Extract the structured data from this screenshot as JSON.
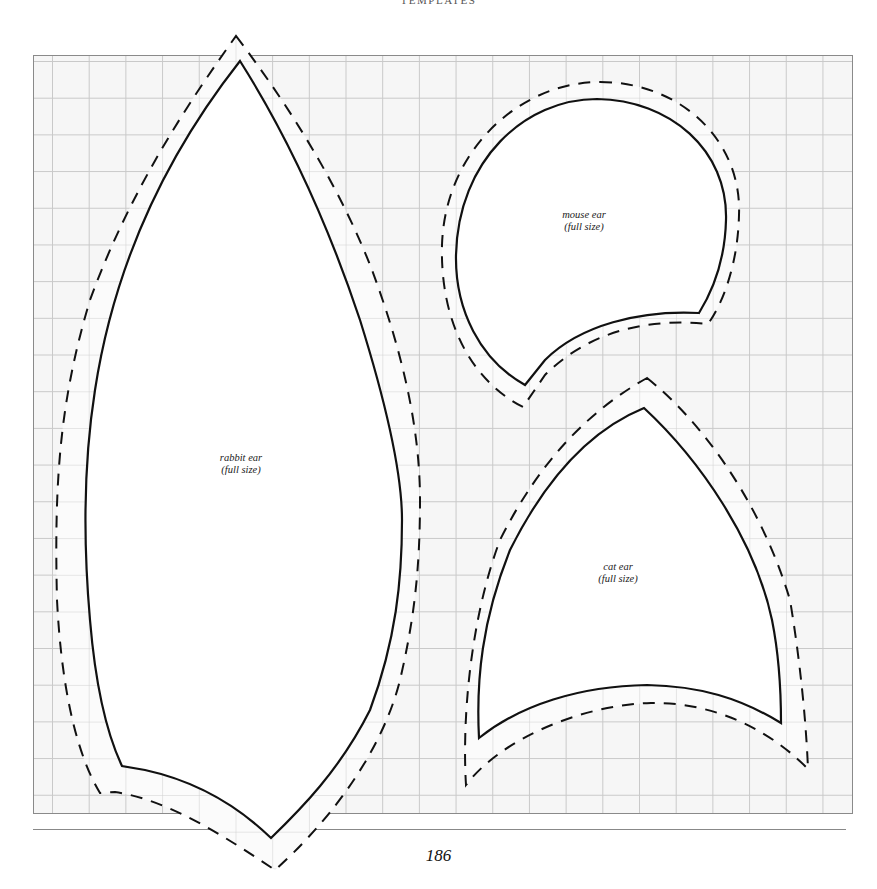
{
  "page": {
    "running_head": "TEMPLATES",
    "page_number": "186"
  },
  "templates": [
    {
      "id": "rabbit",
      "title": "rabbit ear",
      "note": "(full size)"
    },
    {
      "id": "mouse",
      "title": "mouse ear",
      "note": "(full size)"
    },
    {
      "id": "cat",
      "title": "cat ear",
      "note": "(full size)"
    }
  ],
  "legend": {
    "solid_line": "cutting line",
    "dashed_line": "seam allowance"
  },
  "colors": {
    "ink": "#111111",
    "grid": "#c9c9c9",
    "paper": "#f6f6f6"
  }
}
